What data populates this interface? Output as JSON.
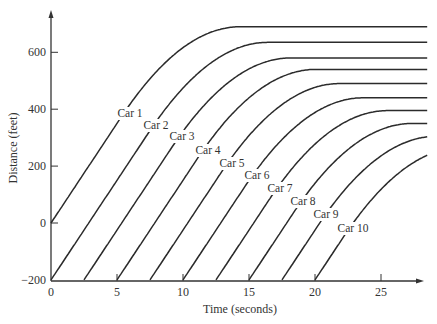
{
  "chart_data": {
    "type": "line",
    "title": "",
    "xlabel": "Time (seconds)",
    "ylabel": "Distance (feet)",
    "xlim": [
      0,
      28.5
    ],
    "ylim": [
      -200,
      730
    ],
    "x_ticks": [
      0,
      5,
      10,
      15,
      20,
      25
    ],
    "x_tick_labels": [
      "0",
      "5",
      "10",
      "15",
      "20",
      "25"
    ],
    "y_ticks": [
      -200,
      0,
      200,
      400,
      600
    ],
    "y_tick_labels": [
      "−200",
      "0",
      "200",
      "400",
      "600"
    ],
    "grid": false,
    "legend": "inline labels",
    "cruise_speed_ft_per_s": 70,
    "decel_duration_s": 9,
    "series": [
      {
        "name": "Car 1",
        "start_time": 0,
        "start_distance": 0,
        "stop_distance": 690,
        "label_pos": [
          130,
          117
        ]
      },
      {
        "name": "Car 2",
        "start_time": 0,
        "start_distance": -200,
        "stop_distance": 635,
        "label_pos": [
          156,
          129
        ]
      },
      {
        "name": "Car 3",
        "start_time": 2.5,
        "start_distance": -200,
        "stop_distance": 580,
        "label_pos": [
          182,
          140
        ]
      },
      {
        "name": "Car 4",
        "start_time": 5,
        "start_distance": -200,
        "stop_distance": 540,
        "label_pos": [
          208,
          154
        ]
      },
      {
        "name": "Car 5",
        "start_time": 7.5,
        "start_distance": -200,
        "stop_distance": 490,
        "label_pos": [
          232,
          167
        ]
      },
      {
        "name": "Car 6",
        "start_time": 10,
        "start_distance": -200,
        "stop_distance": 440,
        "label_pos": [
          257,
          179
        ]
      },
      {
        "name": "Car 7",
        "start_time": 12.5,
        "start_distance": -200,
        "stop_distance": 395,
        "label_pos": [
          280,
          192
        ]
      },
      {
        "name": "Car 8",
        "start_time": 15,
        "start_distance": -200,
        "stop_distance": 350,
        "label_pos": [
          303,
          205
        ]
      },
      {
        "name": "Car 9",
        "start_time": 17.5,
        "start_distance": -200,
        "stop_distance": 305,
        "label_pos": [
          326,
          218
        ]
      },
      {
        "name": "Car 10",
        "start_time": 20,
        "start_distance": -200,
        "stop_distance": 265,
        "label_pos": [
          353,
          232
        ]
      }
    ]
  }
}
